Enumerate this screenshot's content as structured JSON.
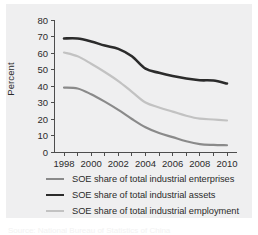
{
  "figure": {
    "background_color": "#ffffff",
    "panel_color": "#efeff0",
    "caption_fragment": "Source: National Bureau of Statistics of China"
  },
  "axes": {
    "ylabel": "Percent",
    "yticks": [
      "0",
      "10",
      "20",
      "30",
      "40",
      "50",
      "60",
      "70",
      "80"
    ],
    "xticks": [
      "1998",
      "2000",
      "2002",
      "2004",
      "2006",
      "2008",
      "2010"
    ],
    "axis_color": "#4d4d4d"
  },
  "legend": {
    "items": [
      {
        "label": "SOE share of total industrial enterprises",
        "color": "#8a8a8a",
        "width": 2.2
      },
      {
        "label": "SOE share of total industrial assets",
        "color": "#2b2b2b",
        "width": 2.6
      },
      {
        "label": "SOE share of total industrial employment",
        "color": "#c2c2c2",
        "width": 2.2
      }
    ]
  },
  "chart_data": {
    "type": "line",
    "title": "",
    "xlabel": "",
    "ylabel": "Percent",
    "xlim": [
      1997,
      2011
    ],
    "ylim": [
      0,
      80
    ],
    "grid": false,
    "legend_position": "below",
    "x": [
      1998,
      1999,
      2000,
      2001,
      2002,
      2003,
      2004,
      2005,
      2006,
      2007,
      2008,
      2009,
      2010
    ],
    "series": [
      {
        "name": "SOE share of total industrial enterprises",
        "color": "#8a8a8a",
        "values": [
          39.0,
          38.5,
          35.0,
          30.5,
          25.5,
          20.0,
          15.0,
          11.5,
          9.0,
          6.5,
          4.8,
          4.3,
          4.1
        ]
      },
      {
        "name": "SOE share of total industrial assets",
        "color": "#2b2b2b",
        "values": [
          68.8,
          68.8,
          67.0,
          64.5,
          62.5,
          58.0,
          50.5,
          48.0,
          46.0,
          44.5,
          43.5,
          43.3,
          41.5
        ]
      },
      {
        "name": "SOE share of total industrial employment",
        "color": "#c2c2c2",
        "values": [
          60.3,
          58.0,
          53.5,
          48.5,
          43.0,
          36.5,
          30.0,
          27.0,
          24.5,
          22.0,
          20.2,
          19.7,
          19.1
        ]
      }
    ]
  }
}
